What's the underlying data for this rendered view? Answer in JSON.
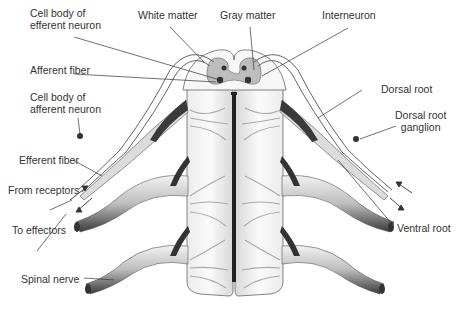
{
  "figure": {
    "colors": {
      "background": "#ffffff",
      "cord_fill": "#f4f4f4",
      "gray_matter": "#bdbdbd",
      "outline": "#555555",
      "label_text": "#333333",
      "leader_line": "#333333",
      "nerve_dark": "#2a2a2a",
      "central_canal": "#222222"
    }
  },
  "labels": {
    "cell_body_efferent": [
      "Cell body of",
      "efferent neuron"
    ],
    "white_matter": "White matter",
    "gray_matter": "Gray matter",
    "interneuron": "Interneuron",
    "afferent_fiber": "Afferent fiber",
    "cell_body_afferent": [
      "Cell body of",
      "afferent neuron"
    ],
    "dorsal_root": "Dorsal root",
    "dorsal_root_ganglion": [
      "Dorsal root",
      "ganglion"
    ],
    "efferent_fiber": "Efferent fiber",
    "from_receptors": "From receptors",
    "to_effectors": "To effectors",
    "ventral_root": "Ventral root",
    "spinal_nerve": "Spinal nerve"
  }
}
